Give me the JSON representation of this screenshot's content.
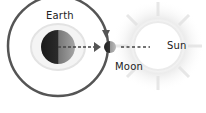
{
  "diagram": {
    "labels": {
      "earth": "Earth",
      "moon": "Moon",
      "sun": "Sun"
    },
    "colors": {
      "orbit": "#555555",
      "earth_dark": "#222222",
      "earth_light": "#9a9a9a",
      "halo": "#e6e6e6",
      "sun_glow": "#e9e9e9",
      "dash": "#444444"
    }
  }
}
